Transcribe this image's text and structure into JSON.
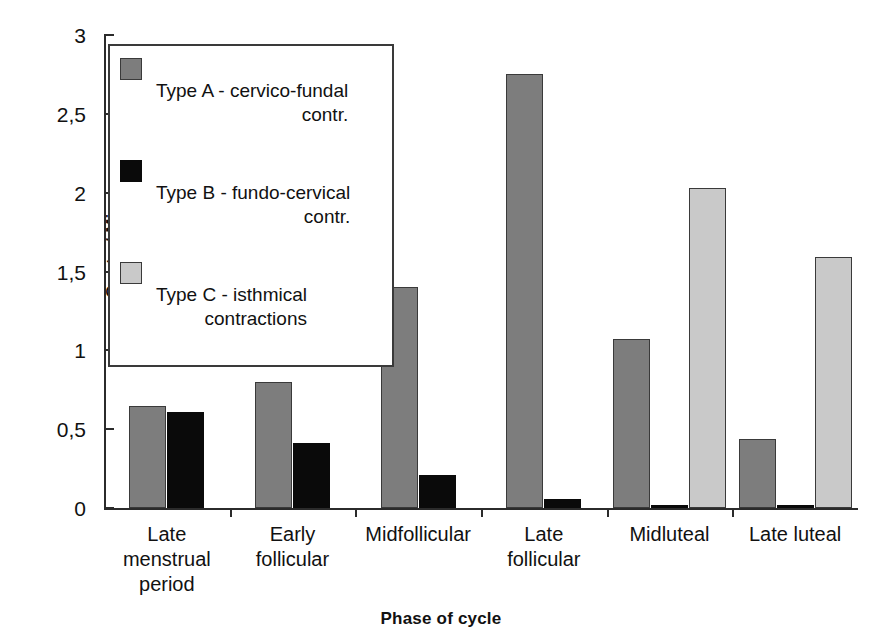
{
  "chart_data": {
    "type": "bar",
    "title": "",
    "xlabel": "Phase of cycle",
    "ylabel": "Contr. / Min.",
    "ylim": [
      0,
      3
    ],
    "ytick_labels": [
      "0",
      "0,5",
      "1",
      "1,5",
      "2",
      "2,5",
      "3"
    ],
    "ytick_values": [
      0,
      0.5,
      1,
      1.5,
      2,
      2.5,
      3
    ],
    "grid": false,
    "legend_position": "upper-left-inside",
    "categories": [
      "Late menstrual period",
      "Early follicular",
      "Midfollicular",
      "Late follicular",
      "Midluteal",
      "Late luteal"
    ],
    "category_lines": [
      [
        "Late",
        "menstrual",
        "period"
      ],
      [
        "Early",
        "follicular"
      ],
      [
        "Midfollicular"
      ],
      [
        "Late",
        "follicular"
      ],
      [
        "Midluteal"
      ],
      [
        "Late luteal"
      ]
    ],
    "series": [
      {
        "name": "Type A - cervico-fundal contr.",
        "legend_line1": "Type A - cervico-fundal",
        "legend_line2": "contr.",
        "color": "#7d7d7d",
        "values": [
          0.65,
          0.8,
          1.4,
          2.75,
          1.07,
          0.44
        ]
      },
      {
        "name": "Type B - fundo-cervical contr.",
        "legend_line1": "Type B - fundo-cervical",
        "legend_line2": "contr.",
        "color": "#0a0a0a",
        "values": [
          0.61,
          0.41,
          0.21,
          0.06,
          0.02,
          0.02
        ]
      },
      {
        "name": "Type C - isthmical contractions",
        "legend_line1": "Type C - isthmical",
        "legend_line2": "contractions",
        "color": "#c9c9c9",
        "values": [
          0,
          0,
          0,
          0,
          2.03,
          1.59
        ]
      }
    ]
  }
}
